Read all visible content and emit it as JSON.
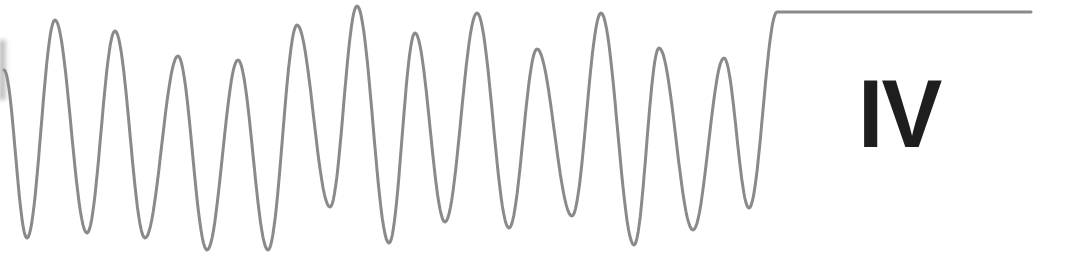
{
  "figure": {
    "label": "IV",
    "trace_color": "#8a8a8a",
    "label_color": "#1e1e1e",
    "background": "#ffffff"
  },
  "chart_data": {
    "type": "line",
    "title": "",
    "xlabel": "",
    "ylabel": "",
    "grid": false,
    "annotation": "IV",
    "points_px": [
      [
        4,
        70
      ],
      [
        27,
        238
      ],
      [
        55,
        20
      ],
      [
        87,
        233
      ],
      [
        115,
        31
      ],
      [
        145,
        238
      ],
      [
        178,
        56
      ],
      [
        207,
        250
      ],
      [
        238,
        60
      ],
      [
        268,
        250
      ],
      [
        297,
        25
      ],
      [
        330,
        207
      ],
      [
        357,
        6
      ],
      [
        389,
        243
      ],
      [
        415,
        33
      ],
      [
        445,
        222
      ],
      [
        477,
        13
      ],
      [
        509,
        228
      ],
      [
        537,
        49
      ],
      [
        572,
        216
      ],
      [
        601,
        13
      ],
      [
        634,
        245
      ],
      [
        659,
        48
      ],
      [
        693,
        230
      ],
      [
        724,
        58
      ],
      [
        749,
        208
      ],
      [
        777,
        12
      ],
      [
        1031,
        12
      ]
    ],
    "peaks_y_px": [
      20,
      31,
      56,
      60,
      25,
      6,
      33,
      13,
      49,
      13,
      48,
      58
    ],
    "troughs_y_px": [
      238,
      233,
      238,
      250,
      250,
      207,
      243,
      222,
      228,
      216,
      245,
      230,
      208
    ],
    "plateau": {
      "x_start": 777,
      "x_end": 1031,
      "y": 12
    }
  }
}
